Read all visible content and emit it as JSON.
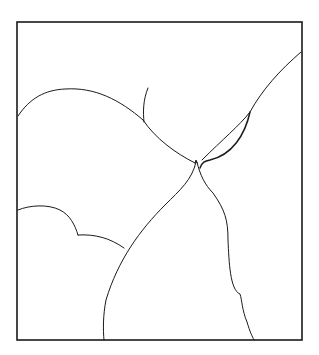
{
  "figure": {
    "type": "line-drawing",
    "stroke_color": "#1a1a1a",
    "background": "#ffffff",
    "frame": {
      "x": 17,
      "y": 22,
      "width": 285,
      "height": 318
    },
    "curves": [
      {
        "name": "upper-left-arc",
        "d": "M18,116 C30,98 45,90 65,89 C95,87 120,100 143,120"
      },
      {
        "name": "short-hook",
        "d": "M148,88 C143,100 143,112 144,122"
      },
      {
        "name": "central-left-branch",
        "d": "M143,120 C155,138 175,153 195,163"
      },
      {
        "name": "upper-right-long-curve",
        "d": "M301,52 C280,70 262,90 250,112 C240,125 222,140 202,160"
      },
      {
        "name": "lens-lower",
        "d": "M250,112 C245,135 232,155 210,160 C205,161 202,162 200,168"
      },
      {
        "name": "cusp-left",
        "d": "M195,163 L196,160 L197,163"
      },
      {
        "name": "main-left-boundary",
        "d": "M196,162 C192,180 180,190 165,205 C140,230 118,260 106,300 C103,315 103,330 104,340"
      },
      {
        "name": "main-right-boundary",
        "d": "M197,162 C200,175 205,185 213,193 C225,210 228,220 228,240 C229,262 230,290 240,294 C242,300 242,310 247,322 C250,332 252,336 254,340"
      },
      {
        "name": "lower-left-bump",
        "d": "M18,210 C30,205 48,204 60,210 C70,215 75,225 78,235"
      },
      {
        "name": "lower-left-shoulder",
        "d": "M78,235 C95,234 110,238 124,248"
      }
    ]
  }
}
